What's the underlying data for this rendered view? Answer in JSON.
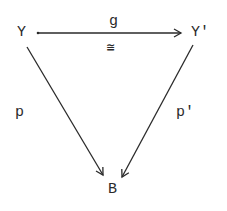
{
  "diagram": {
    "type": "commutative-triangle",
    "nodes": {
      "top_left": "Y",
      "top_right": "Y'",
      "bottom": "B"
    },
    "edges": {
      "top": {
        "from": "Y",
        "to": "Y'",
        "label": "g",
        "annotation": "≅"
      },
      "left": {
        "from": "Y",
        "to": "B",
        "label": "p"
      },
      "right": {
        "from": "Y'",
        "to": "B",
        "label": "p'"
      }
    },
    "colors": {
      "ink": "#2a2a2a",
      "background": "#ffffff"
    }
  }
}
